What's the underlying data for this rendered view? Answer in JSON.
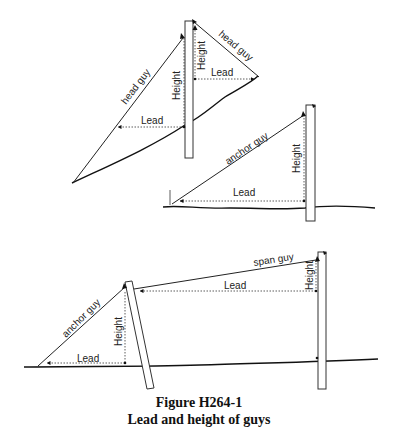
{
  "figure": {
    "caption_number": "Figure H264-1",
    "caption_title": "Lead and height of guys"
  },
  "diagrams": {
    "top_left": {
      "left_guy_label": "head guy",
      "right_guy_label": "head guy",
      "left_height_label": "Height",
      "right_height_label": "Height",
      "left_lead_label": "Lead",
      "right_lead_label": "Lead"
    },
    "middle_right": {
      "guy_label": "anchor guy",
      "height_label": "Height",
      "lead_label": "Lead"
    },
    "bottom": {
      "anchor_guy_label": "anchor guy",
      "anchor_height_label": "Height",
      "anchor_lead_label": "Lead",
      "span_guy_label": "span guy",
      "span_height_label": "Height",
      "span_lead_label": "Lead"
    }
  }
}
